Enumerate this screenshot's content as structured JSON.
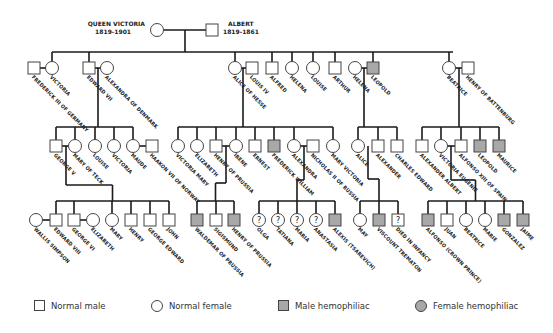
{
  "colors": {
    "line": "#1a1a1a",
    "affected": "#a8a8a8",
    "outline": "#444444"
  },
  "founders": {
    "female": {
      "name": "QUEEN VICTORIA",
      "years": "1819-1901"
    },
    "male": {
      "name": "ALBERT",
      "years": "1819-1861"
    }
  },
  "generation2": [
    {
      "name": "FREDERICK III OF GERMANY",
      "sex": "M",
      "status": "normal",
      "x": 34
    },
    {
      "name": "VICTORIA",
      "sex": "F",
      "status": "normal",
      "x": 52
    },
    {
      "name": "EDWARD VII",
      "sex": "M",
      "status": "normal",
      "x": 89
    },
    {
      "name": "ALEXANDRA OF DENMARK",
      "sex": "F",
      "status": "normal",
      "x": 107
    },
    {
      "name": "ALICE OF HESSE",
      "sex": "F",
      "status": "normal",
      "x": 235
    },
    {
      "name": "LOUIS IV",
      "sex": "M",
      "status": "normal",
      "x": 252
    },
    {
      "name": "ALFRED",
      "sex": "M",
      "status": "normal",
      "x": 272
    },
    {
      "name": "HELENA",
      "sex": "F",
      "status": "normal",
      "x": 292
    },
    {
      "name": "LOUISE",
      "sex": "F",
      "status": "normal",
      "x": 313
    },
    {
      "name": "ARTHUR",
      "sex": "M",
      "status": "normal",
      "x": 335
    },
    {
      "name": "HELENA",
      "sex": "F",
      "status": "normal",
      "x": 355
    },
    {
      "name": "LEOPOLD",
      "sex": "M",
      "status": "affected",
      "x": 373
    },
    {
      "name": "BEATRICE",
      "sex": "F",
      "status": "normal",
      "x": 449
    },
    {
      "name": "HENRY OF BATTENBURG",
      "sex": "M",
      "status": "normal",
      "x": 468
    }
  ],
  "generation3": [
    {
      "name": "GEORGE V",
      "sex": "M",
      "status": "normal",
      "x": 56
    },
    {
      "name": "MARY OF TECK",
      "sex": "F",
      "status": "normal",
      "x": 75
    },
    {
      "name": "LOUISE",
      "sex": "F",
      "status": "normal",
      "x": 95
    },
    {
      "name": "VICTORIA",
      "sex": "F",
      "status": "normal",
      "x": 114
    },
    {
      "name": "MAUDE",
      "sex": "F",
      "status": "normal",
      "x": 133
    },
    {
      "name": "HAAKON VII OF NORWAY",
      "sex": "M",
      "status": "normal",
      "x": 152
    },
    {
      "name": "VICTORIA MARY",
      "sex": "F",
      "status": "normal",
      "x": 178
    },
    {
      "name": "ELIZABETH",
      "sex": "F",
      "status": "normal",
      "x": 197
    },
    {
      "name": "HENRY OF PRUSSIA",
      "sex": "M",
      "status": "normal",
      "x": 216
    },
    {
      "name": "IRENE",
      "sex": "F",
      "status": "normal",
      "x": 236
    },
    {
      "name": "ERNEST",
      "sex": "M",
      "status": "normal",
      "x": 255
    },
    {
      "name": "FREDERICK WILLIAM",
      "sex": "M",
      "status": "affected",
      "x": 274
    },
    {
      "name": "ALEXANDRA",
      "sex": "F",
      "status": "normal",
      "x": 294
    },
    {
      "name": "NICHOLAS II OF RUSSIA",
      "sex": "M",
      "status": "normal",
      "x": 313
    },
    {
      "name": "MARY VICTORIA",
      "sex": "F",
      "status": "normal",
      "x": 333
    },
    {
      "name": "ALICE",
      "sex": "F",
      "status": "normal",
      "x": 358
    },
    {
      "name": "ALEXANDER",
      "sex": "M",
      "status": "normal",
      "x": 378
    },
    {
      "name": "CHARLES EDWARD",
      "sex": "M",
      "status": "normal",
      "x": 397
    },
    {
      "name": "ALEXANDER ALBERT",
      "sex": "M",
      "status": "normal",
      "x": 422
    },
    {
      "name": "VICTORIA EUGENIE",
      "sex": "F",
      "status": "normal",
      "x": 441
    },
    {
      "name": "ALFONSO XIII OF SPAIN",
      "sex": "M",
      "status": "normal",
      "x": 461
    },
    {
      "name": "LEOPOLD",
      "sex": "M",
      "status": "affected",
      "x": 480
    },
    {
      "name": "MAURICE",
      "sex": "M",
      "status": "affected",
      "x": 499
    }
  ],
  "generation4": [
    {
      "name": "WALLIS SIMPSON",
      "sex": "F",
      "status": "normal",
      "x": 36
    },
    {
      "name": "EDWARD VIII",
      "sex": "M",
      "status": "normal",
      "x": 56
    },
    {
      "name": "GEORGE VI",
      "sex": "M",
      "status": "normal",
      "x": 74
    },
    {
      "name": "ELIZABETH",
      "sex": "F",
      "status": "normal",
      "x": 93
    },
    {
      "name": "MARY",
      "sex": "F",
      "status": "normal",
      "x": 112
    },
    {
      "name": "HENRY",
      "sex": "M",
      "status": "normal",
      "x": 131
    },
    {
      "name": "GEORGE EDWARD",
      "sex": "M",
      "status": "normal",
      "x": 150
    },
    {
      "name": "JOHN",
      "sex": "M",
      "status": "normal",
      "x": 169
    },
    {
      "name": "WALDEMAR OF PRUSSIA",
      "sex": "M",
      "status": "affected",
      "x": 197
    },
    {
      "name": "SIGISMUND",
      "sex": "M",
      "status": "normal",
      "x": 216
    },
    {
      "name": "HENRY OF PRUSSIA",
      "sex": "M",
      "status": "affected",
      "x": 234
    },
    {
      "name": "OLGA",
      "sex": "F",
      "status": "unknown",
      "x": 259
    },
    {
      "name": "TATIANA",
      "sex": "F",
      "status": "unknown",
      "x": 278
    },
    {
      "name": "MARIA",
      "sex": "F",
      "status": "unknown",
      "x": 297
    },
    {
      "name": "ANASTASIA",
      "sex": "F",
      "status": "unknown",
      "x": 316
    },
    {
      "name": "ALEXIS (TSAREVICH)",
      "sex": "M",
      "status": "affected",
      "x": 335
    },
    {
      "name": "MAY",
      "sex": "F",
      "status": "normal",
      "x": 360
    },
    {
      "name": "VISCOUNT TREMATON",
      "sex": "M",
      "status": "affected",
      "x": 379
    },
    {
      "name": "DIED IN INFANCY",
      "sex": "M",
      "status": "unknown",
      "x": 398
    },
    {
      "name": "ALFONSO (CROWN PRINCE)",
      "sex": "M",
      "status": "affected",
      "x": 428
    },
    {
      "name": "JUAN",
      "sex": "M",
      "status": "normal",
      "x": 447
    },
    {
      "name": "BEATRICE",
      "sex": "F",
      "status": "normal",
      "x": 466
    },
    {
      "name": "MARIE",
      "sex": "F",
      "status": "normal",
      "x": 485
    },
    {
      "name": "GONZALEZ",
      "sex": "M",
      "status": "affected",
      "x": 504
    },
    {
      "name": "JAIME",
      "sex": "M",
      "status": "affected",
      "x": 523
    }
  ],
  "unknown_glyph": "?",
  "legend": [
    {
      "label": "Normal male",
      "shape": "square",
      "status": "normal"
    },
    {
      "label": "Normal female",
      "shape": "circle",
      "status": "normal"
    },
    {
      "label": "Male hemophiliac",
      "shape": "square",
      "status": "affected"
    },
    {
      "label": "Female hemophiliac",
      "shape": "circle",
      "status": "affected"
    }
  ]
}
